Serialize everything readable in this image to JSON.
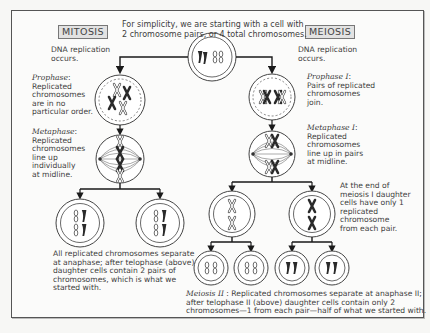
{
  "title_note": "For simplicity, we are starting with a cell with 2 chromosome pairs, or 4 total chromosomes.",
  "title_note_lines": [
    "For simplicity, we are starting with a cell with",
    "2 chromosome pairs, or 4 total chromosomes."
  ],
  "mitosis": {
    "label": "MITOSIS",
    "dna_replication": [
      "DNA replication",
      "occurs."
    ],
    "prophase": {
      "term": "Prophase",
      "lines": [
        "Replicated",
        "chromosomes",
        "are in no",
        "particular order."
      ]
    },
    "metaphase": {
      "term": "Metaphase",
      "lines": [
        "Replicated",
        "chromosomes",
        "line up",
        "individually",
        "at midline."
      ]
    },
    "summary": {
      "lines": [
        "All replicated chromosomes separate",
        "at anaphase; after telophase (above)",
        "daughter cells contain 2 pairs of",
        "chromosomes, which is what we",
        "started with."
      ],
      "anaphase_term": "anaphase",
      "telophase_term": "telophase"
    }
  },
  "meiosis": {
    "label": "MEIOSIS",
    "dna_replication": [
      "DNA replication",
      "occurs."
    ],
    "prophase1": {
      "term": "Prophase I",
      "lines": [
        "Pairs of replicated",
        "chromosomes",
        "join."
      ]
    },
    "metaphase1": {
      "term": "Metaphase I",
      "lines": [
        "Replicated",
        "chromosomes",
        "line up in pairs",
        "at midline."
      ]
    },
    "end_of_meiosis1": {
      "lines": [
        "At the end of",
        "meiosis I daughter",
        "cells have only 1",
        "replicated",
        "chromosome",
        "from each pair."
      ]
    },
    "meiosis2": {
      "term": "Meiosis II",
      "lines": [
        ": Replicated chromosomes separate at anaphase II;",
        "after telophase II (above) daughter cells contain only 2",
        "chromosomes—1 from each pair—half of what we started with."
      ]
    }
  },
  "colors": {
    "frame": "#555555",
    "text": "#3d3d3d",
    "arrow": "#1a1a1a",
    "chromosome_dark": "#2a2a2a",
    "chromosome_light": "#ffffff",
    "label_box_bg": "#e2e2e2"
  }
}
